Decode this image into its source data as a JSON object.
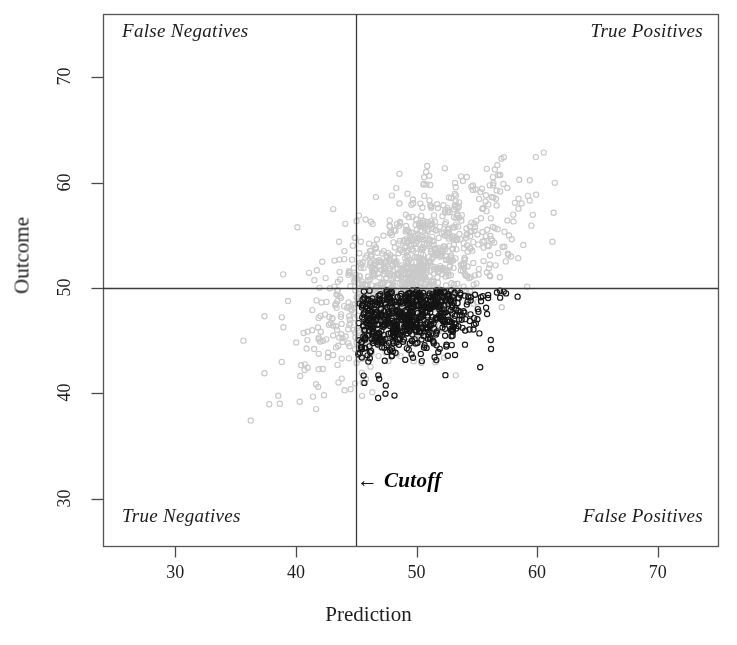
{
  "chart_data": {
    "type": "scatter",
    "title": "",
    "xlabel": "Prediction",
    "ylabel": "Outcome",
    "xlim": [
      24,
      75
    ],
    "ylim": [
      25.5,
      76
    ],
    "grid": false,
    "legend_position": "none",
    "xticks": [
      30,
      40,
      50,
      60,
      70
    ],
    "yticks": [
      30,
      40,
      50,
      60,
      70
    ],
    "xtick_labels": [
      "30",
      "40",
      "50",
      "60",
      "70"
    ],
    "ytick_labels": [
      "30",
      "40",
      "50",
      "60",
      "70"
    ],
    "cutoff_x": 45,
    "cutoff_y": 50,
    "annotations": [
      {
        "name": "false-negatives",
        "text": "False Negatives",
        "quadrant": "top-left"
      },
      {
        "name": "true-positives",
        "text": "True Positives",
        "quadrant": "top-right"
      },
      {
        "name": "true-negatives",
        "text": "True Negatives",
        "quadrant": "bottom-left"
      },
      {
        "name": "false-positives",
        "text": "False Positives",
        "quadrant": "bottom-right"
      },
      {
        "name": "cutoff",
        "text": "Cutoff",
        "arrow": "←",
        "x": 45,
        "y": 31
      }
    ],
    "series": [
      {
        "name": "gray-points",
        "color": "#c9c9c9",
        "marker": "open-circle",
        "marker_size": 5.2,
        "n": 1100,
        "mean_x": 49.5,
        "mean_y": 51.2,
        "sd_x": 4.0,
        "sd_y": 4.2,
        "correlation": 0.62
      },
      {
        "name": "black-points",
        "color": "#141414",
        "marker": "open-circle",
        "marker_size": 5.2,
        "n": 560,
        "mean_x": 49.6,
        "mean_y": 47.4,
        "sd_x": 2.9,
        "sd_y": 1.9,
        "correlation": 0.3,
        "clipped_region": {
          "x_min": 45,
          "y_max": 50
        }
      }
    ]
  },
  "axes": {
    "frame_color": "#555555",
    "cutoff_line_color": "#3a3a3a"
  },
  "x_axis": {
    "title": "Prediction",
    "ticks": [
      {
        "value": 30,
        "label": "30"
      },
      {
        "value": 40,
        "label": "40"
      },
      {
        "value": 50,
        "label": "50"
      },
      {
        "value": 60,
        "label": "60"
      },
      {
        "value": 70,
        "label": "70"
      }
    ]
  },
  "y_axis": {
    "title": "Outcome",
    "ticks": [
      {
        "value": 30,
        "label": "30"
      },
      {
        "value": 40,
        "label": "40"
      },
      {
        "value": 50,
        "label": "50"
      },
      {
        "value": 60,
        "label": "60"
      },
      {
        "value": 70,
        "label": "70"
      }
    ]
  },
  "quadrant_labels": {
    "top_left": "False Negatives",
    "top_right": "True Positives",
    "bottom_left": "True Negatives",
    "bottom_right": "False Positives"
  },
  "cutoff": {
    "arrow": "←",
    "label": "Cutoff"
  }
}
